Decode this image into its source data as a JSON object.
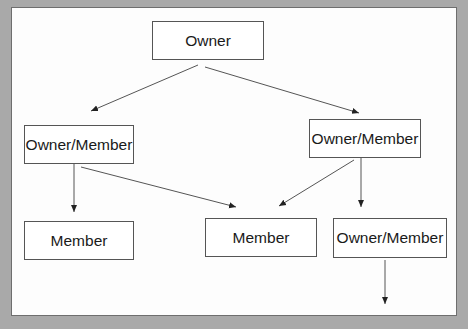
{
  "diagram": {
    "type": "hierarchy",
    "nodes": [
      {
        "id": "owner",
        "label": "Owner"
      },
      {
        "id": "om_left",
        "label": "Owner/Member"
      },
      {
        "id": "om_right",
        "label": "Owner/Member"
      },
      {
        "id": "member_left",
        "label": "Member"
      },
      {
        "id": "member_mid",
        "label": "Member"
      },
      {
        "id": "om_bottom_right",
        "label": "Owner/Member"
      }
    ],
    "edges": [
      {
        "from": "owner",
        "to": "om_left"
      },
      {
        "from": "owner",
        "to": "om_right"
      },
      {
        "from": "om_left",
        "to": "member_left"
      },
      {
        "from": "om_left",
        "to": "member_mid"
      },
      {
        "from": "om_right",
        "to": "member_mid"
      },
      {
        "from": "om_right",
        "to": "om_bottom_right"
      },
      {
        "from": "om_bottom_right",
        "to": "(continues below)"
      }
    ],
    "colors": {
      "background": "#a9a9a9",
      "canvas": "#fdfdfd",
      "stroke": "#555555"
    }
  }
}
